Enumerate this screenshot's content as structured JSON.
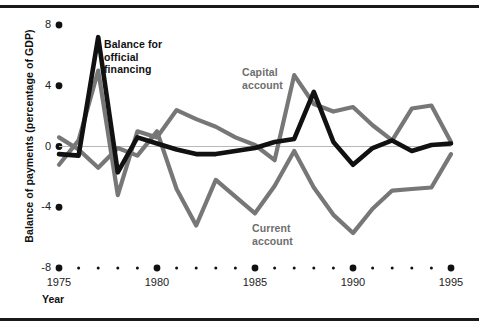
{
  "axes": {
    "y_title": "Balance of payments (percentage of GDP)",
    "x_title": "Year",
    "y_ticks": [
      "8",
      "4",
      "0",
      "-4",
      "-8"
    ],
    "y_tick_values": [
      8,
      4,
      0,
      -4,
      -8
    ],
    "x_ticks": [
      "1975",
      "1980",
      "1985",
      "1990",
      "1995"
    ],
    "x_tick_values": [
      1975,
      1980,
      1985,
      1990,
      1995
    ]
  },
  "labels": {
    "balance_official": "Balance for\nofficial\nfinancing",
    "balance_official_line1": "Balance for",
    "balance_official_line2": "official",
    "balance_official_line3": "financing",
    "capital_line1": "Capital",
    "capital_line2": "account",
    "current_line1": "Current",
    "current_line2": "account"
  },
  "colors": {
    "balance_official": "#111111",
    "capital_account": "#777777",
    "current_account": "#777777",
    "axis": "#111111",
    "zero_line": "#b8b8b8",
    "rule": "#1a1a1a"
  },
  "chart_data": {
    "type": "line",
    "title": "",
    "xlabel": "Year",
    "ylabel": "Balance of payments (percentage of GDP)",
    "xlim": [
      1975,
      1995
    ],
    "ylim": [
      -8,
      8
    ],
    "grid": false,
    "legend": "inline-annotations",
    "x": [
      1975,
      1976,
      1977,
      1978,
      1979,
      1980,
      1981,
      1982,
      1983,
      1984,
      1985,
      1986,
      1987,
      1988,
      1989,
      1990,
      1991,
      1992,
      1993,
      1994,
      1995
    ],
    "series": [
      {
        "name": "Balance for official financing",
        "color": "#111111",
        "values": [
          -0.5,
          -0.6,
          7.2,
          -1.7,
          0.6,
          0.2,
          -0.2,
          -0.5,
          -0.5,
          -0.3,
          -0.1,
          0.3,
          0.5,
          3.6,
          0.3,
          -1.2,
          -0.1,
          0.4,
          -0.3,
          0.1,
          0.2
        ]
      },
      {
        "name": "Capital account",
        "color": "#777777",
        "values": [
          -1.2,
          0.4,
          5.0,
          -3.2,
          1.0,
          0.6,
          2.4,
          1.8,
          1.3,
          0.6,
          0.1,
          -0.9,
          4.7,
          2.8,
          2.3,
          2.6,
          1.4,
          0.4,
          2.5,
          2.7,
          0.3
        ]
      },
      {
        "name": "Current account",
        "color": "#777777",
        "values": [
          0.6,
          -0.2,
          -1.4,
          -0.1,
          -0.6,
          1.0,
          -2.8,
          -5.2,
          -2.2,
          -3.3,
          -4.4,
          -2.6,
          -0.3,
          -2.7,
          -4.5,
          -5.7,
          -4.1,
          -2.9,
          -2.8,
          -2.7,
          -0.5
        ]
      }
    ]
  },
  "geometry": {
    "x_px_1975": 59,
    "x_px_1995": 451,
    "y_px_8": 25,
    "y_px_neg8": 268,
    "y_px_0": 146.5
  }
}
